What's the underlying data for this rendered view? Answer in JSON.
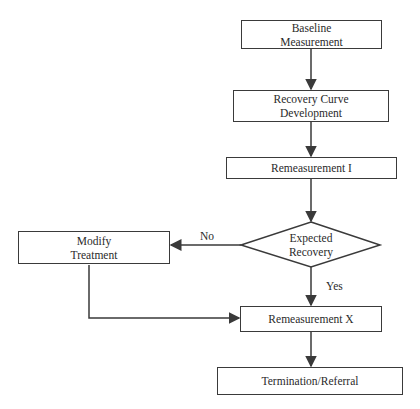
{
  "nodes": {
    "baseline": {
      "line1": "Baseline",
      "line2": "Measurement"
    },
    "recovery_curve": {
      "line1": "Recovery Curve",
      "line2": "Development"
    },
    "remeasurement_1": {
      "label": "Remeasurement I"
    },
    "decision": {
      "line1": "Expected",
      "line2": "Recovery"
    },
    "modify": {
      "line1": "Modify",
      "line2": "Treatment"
    },
    "remeasurement_x": {
      "label": "Remeasurement X"
    },
    "termination": {
      "label": "Termination/Referral"
    }
  },
  "edges": {
    "no_label": "No",
    "yes_label": "Yes"
  },
  "colors": {
    "stroke": "#3a3a3a",
    "text": "#2a2a2a"
  }
}
